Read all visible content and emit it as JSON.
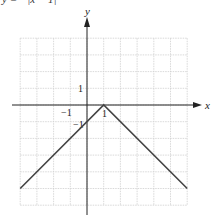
{
  "caption": "y = −|x − 1|",
  "chart_data": {
    "type": "line",
    "title": "",
    "xlabel": "x",
    "ylabel": "y",
    "xlim": [
      -4,
      6
    ],
    "ylim": [
      -6,
      4
    ],
    "grid": true,
    "tick_labels": {
      "x": [
        "-1",
        "1"
      ],
      "y": [
        "1",
        "-1"
      ]
    },
    "series": [
      {
        "name": "y = -|x - 1|",
        "points": [
          [
            -4,
            -5
          ],
          [
            1,
            0
          ],
          [
            6,
            -5
          ]
        ],
        "color": "#444444"
      }
    ]
  },
  "labels": {
    "x_axis": "x",
    "y_axis": "y",
    "x_neg1": "−1",
    "x_pos1": "1",
    "y_pos1": "1",
    "y_neg1": "−1"
  }
}
